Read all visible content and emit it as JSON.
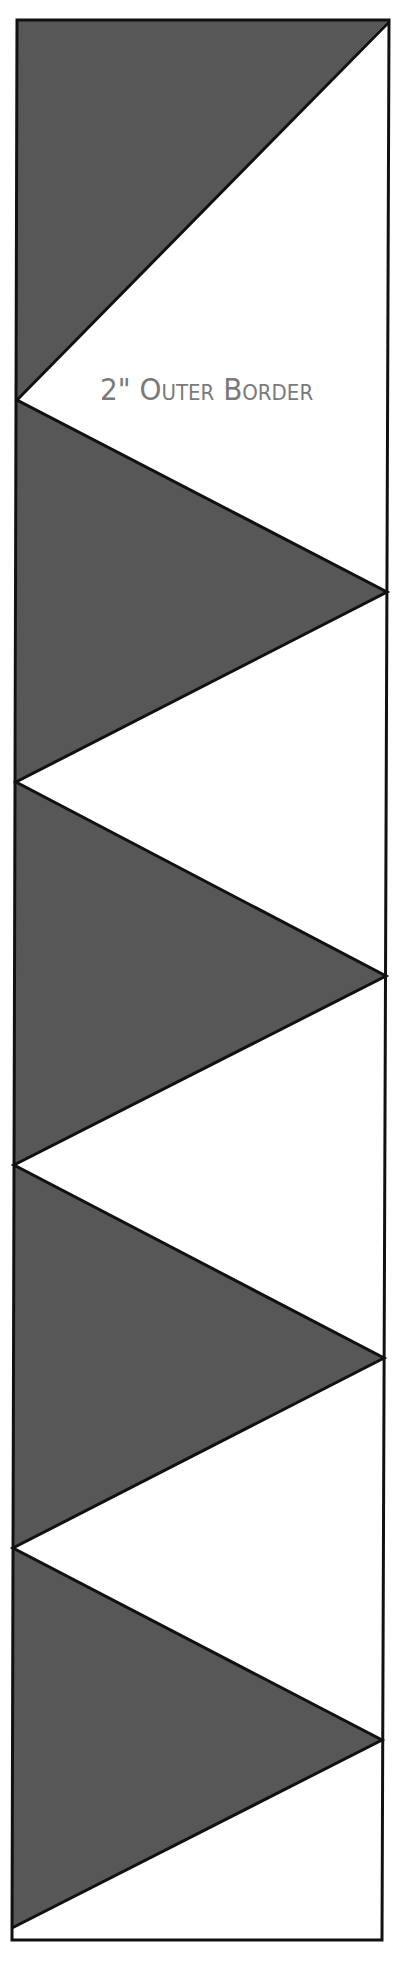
{
  "diagram": {
    "label": "2\" Outer Border",
    "colors": {
      "dark_fill": "#575757",
      "light_fill": "#ffffff",
      "outline": "#111111",
      "label_text": "#7a7a7a"
    },
    "border_strip": {
      "frame": {
        "top_left": [
          17,
          20
        ],
        "top_right": [
          389,
          20
        ],
        "bottom_right": [
          382,
          1940
        ],
        "bottom_left": [
          12,
          1940
        ]
      },
      "zigzag_vertices": [
        {
          "side": "right",
          "x": 389,
          "y": 22
        },
        {
          "side": "left",
          "x": 17,
          "y": 400
        },
        {
          "side": "right",
          "x": 387,
          "y": 592
        },
        {
          "side": "left",
          "x": 16,
          "y": 782
        },
        {
          "side": "right",
          "x": 386,
          "y": 976
        },
        {
          "side": "left",
          "x": 14,
          "y": 1165
        },
        {
          "side": "right",
          "x": 384,
          "y": 1358
        },
        {
          "side": "left",
          "x": 13,
          "y": 1548
        },
        {
          "side": "right",
          "x": 382,
          "y": 1740
        },
        {
          "side": "left",
          "x": 12,
          "y": 1928
        }
      ],
      "dark_triangles": 5,
      "light_triangles": 5
    }
  }
}
